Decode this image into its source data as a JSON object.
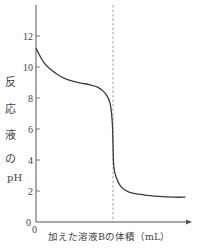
{
  "chart_data": {
    "type": "line",
    "title": "",
    "xlabel": "加えた溶液Bの体積（mL）",
    "ylabel": "反応液のpH",
    "ylabel_chars": [
      "反",
      "応",
      "液",
      "の",
      "pH"
    ],
    "x_origin_label": "0",
    "y_ticks": [
      0,
      2,
      4,
      6,
      8,
      10,
      12
    ],
    "y_tick_labels": [
      "0",
      "2",
      "4",
      "6",
      "8",
      "10",
      "12"
    ],
    "ylim": [
      0,
      14
    ],
    "xlim": [
      0,
      10
    ],
    "grid": false,
    "legend": null,
    "equivalence_point_x": 5.0,
    "annotations": [
      "dashed vertical line at equivalence point"
    ],
    "series": [
      {
        "name": "pH curve",
        "x": [
          0,
          0.5,
          1.0,
          1.5,
          2.0,
          2.5,
          3.0,
          3.5,
          4.0,
          4.5,
          4.8,
          4.95,
          5.0,
          5.05,
          5.2,
          5.5,
          6.0,
          7.0,
          8.0,
          9.0,
          9.7
        ],
        "y": [
          11.2,
          10.3,
          9.8,
          9.45,
          9.2,
          9.05,
          8.95,
          8.85,
          8.7,
          8.3,
          7.7,
          6.5,
          5.0,
          3.6,
          2.9,
          2.3,
          1.95,
          1.75,
          1.65,
          1.6,
          1.6
        ]
      }
    ]
  },
  "colors": {
    "axis": "#555555",
    "curve": "#3a3a3a",
    "dashed_line": "#888888"
  }
}
